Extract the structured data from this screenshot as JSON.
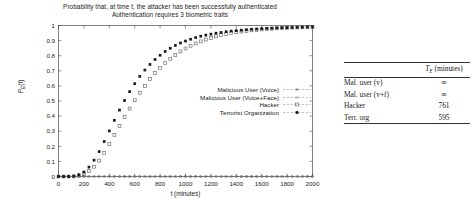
{
  "figure": {
    "title_line1": "Probability that, at time t, the attacker has been successfully authenticated",
    "title_line2": "Authentication requires 3 biometric traits"
  },
  "axes": {
    "xlabel": "t (minutes)",
    "ylabel_main": "P",
    "ylabel_sub": "E",
    "ylabel_tail": "(t)",
    "xticks": [
      "0",
      "200",
      "400",
      "600",
      "800",
      "1000",
      "1200",
      "1400",
      "1600",
      "1800",
      "2000"
    ],
    "yticks": [
      "0",
      "0.1",
      "0.2",
      "0.3",
      "0.4",
      "0.5",
      "0.6",
      "0.7",
      "0.8",
      "0.9",
      "1"
    ]
  },
  "legend": {
    "items": [
      {
        "label": "Malicious User (Voice)",
        "marker": "plus-marker"
      },
      {
        "label": "Malicious User (Voice+Face)",
        "marker": "cross-marker"
      },
      {
        "label": "Hacker",
        "marker": "open-square-marker"
      },
      {
        "label": "Terrorist Organization",
        "marker": "filled-square-marker"
      }
    ]
  },
  "table": {
    "header_value": "(minutes)",
    "rows": [
      {
        "name": "Mal. user (v)",
        "value": "∞"
      },
      {
        "name": "Mal. user (v+f)",
        "value": "∞"
      },
      {
        "name": "Hacker",
        "value": "761"
      },
      {
        "name": "Terr. org",
        "value": "595"
      }
    ]
  },
  "chart_data": {
    "type": "scatter",
    "xlabel": "t (minutes)",
    "ylabel": "P_E(t)",
    "xlim": [
      0,
      2000
    ],
    "ylim": [
      0,
      1
    ],
    "xticks": [
      0,
      200,
      400,
      600,
      800,
      1000,
      1200,
      1400,
      1600,
      1800,
      2000
    ],
    "yticks": [
      0,
      0.1,
      0.2,
      0.3,
      0.4,
      0.5,
      0.6,
      0.7,
      0.8,
      0.9,
      1.0
    ],
    "grid": false,
    "legend_position": "inside-center-right",
    "x": [
      0,
      40,
      80,
      120,
      160,
      200,
      240,
      280,
      320,
      360,
      400,
      440,
      480,
      520,
      560,
      600,
      640,
      680,
      720,
      760,
      800,
      840,
      880,
      920,
      960,
      1000,
      1040,
      1080,
      1120,
      1160,
      1200,
      1240,
      1280,
      1320,
      1360,
      1400,
      1440,
      1480,
      1520,
      1560,
      1600,
      1640,
      1680,
      1720,
      1760,
      1800,
      1840,
      1880,
      1920,
      1960,
      2000
    ],
    "series": [
      {
        "name": "Malicious User (Voice)",
        "marker": "plus",
        "values": [
          0,
          0,
          0,
          0,
          0,
          0,
          0,
          0,
          0,
          0,
          0,
          0,
          0,
          0,
          0,
          0,
          0,
          0,
          0,
          0,
          0,
          0,
          0,
          0,
          0,
          0,
          0,
          0,
          0,
          0,
          0,
          0,
          0,
          0,
          0,
          0,
          0,
          0,
          0,
          0,
          0,
          0,
          0,
          0,
          0,
          0,
          0,
          0,
          0,
          0,
          0
        ]
      },
      {
        "name": "Malicious User (Voice+Face)",
        "marker": "cross",
        "values": [
          0,
          0,
          0,
          0,
          0,
          0,
          0,
          0,
          0,
          0,
          0,
          0,
          0,
          0,
          0,
          0,
          0,
          0,
          0,
          0,
          0,
          0,
          0,
          0,
          0,
          0,
          0,
          0,
          0,
          0,
          0,
          0,
          0,
          0,
          0,
          0,
          0,
          0,
          0,
          0,
          0,
          0,
          0,
          0,
          0,
          0,
          0,
          0,
          0,
          0,
          0
        ]
      },
      {
        "name": "Hacker",
        "marker": "open-square",
        "values": [
          0,
          0,
          0,
          0,
          0.005,
          0.015,
          0.035,
          0.065,
          0.105,
          0.155,
          0.215,
          0.275,
          0.335,
          0.395,
          0.45,
          0.505,
          0.555,
          0.6,
          0.645,
          0.685,
          0.72,
          0.752,
          0.78,
          0.805,
          0.828,
          0.848,
          0.866,
          0.881,
          0.895,
          0.907,
          0.918,
          0.928,
          0.936,
          0.943,
          0.95,
          0.955,
          0.96,
          0.964,
          0.968,
          0.971,
          0.974,
          0.977,
          0.979,
          0.981,
          0.983,
          0.984,
          0.986,
          0.987,
          0.988,
          0.989,
          0.99
        ]
      },
      {
        "name": "Terrorist Organization",
        "marker": "filled-square",
        "values": [
          0,
          0,
          0,
          0.003,
          0.012,
          0.03,
          0.062,
          0.108,
          0.165,
          0.232,
          0.302,
          0.372,
          0.44,
          0.503,
          0.562,
          0.615,
          0.663,
          0.705,
          0.742,
          0.775,
          0.803,
          0.828,
          0.849,
          0.868,
          0.884,
          0.897,
          0.909,
          0.92,
          0.929,
          0.936,
          0.943,
          0.949,
          0.954,
          0.959,
          0.963,
          0.966,
          0.969,
          0.972,
          0.975,
          0.977,
          0.979,
          0.981,
          0.982,
          0.984,
          0.985,
          0.986,
          0.987,
          0.988,
          0.989,
          0.99,
          0.991
        ]
      }
    ]
  }
}
